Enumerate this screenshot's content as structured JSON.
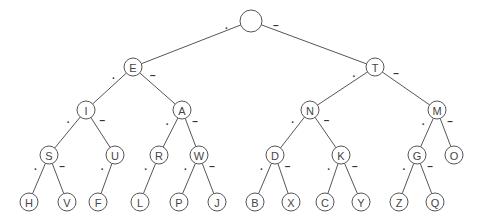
{
  "diagram": {
    "dot_symbol": ".",
    "dash_symbol": "–",
    "colors": {
      "stroke": "#555555",
      "text": "#444444",
      "background": "#ffffff"
    },
    "nodes": [
      {
        "id": "root",
        "label": "",
        "x": 251,
        "y": 21,
        "r": 11
      },
      {
        "id": "E",
        "label": "E",
        "x": 133,
        "y": 67,
        "r": 9
      },
      {
        "id": "T",
        "label": "T",
        "x": 375,
        "y": 67,
        "r": 9
      },
      {
        "id": "I",
        "label": "I",
        "x": 86,
        "y": 110,
        "r": 9
      },
      {
        "id": "A",
        "label": "A",
        "x": 182,
        "y": 110,
        "r": 9
      },
      {
        "id": "N",
        "label": "N",
        "x": 310,
        "y": 110,
        "r": 9
      },
      {
        "id": "M",
        "label": "M",
        "x": 437,
        "y": 110,
        "r": 9
      },
      {
        "id": "S",
        "label": "S",
        "x": 49,
        "y": 155,
        "r": 9
      },
      {
        "id": "U",
        "label": "U",
        "x": 115,
        "y": 155,
        "r": 9
      },
      {
        "id": "R",
        "label": "R",
        "x": 159,
        "y": 155,
        "r": 9
      },
      {
        "id": "W",
        "label": "W",
        "x": 199,
        "y": 155,
        "r": 9
      },
      {
        "id": "D",
        "label": "D",
        "x": 275,
        "y": 155,
        "r": 9
      },
      {
        "id": "K",
        "label": "K",
        "x": 341,
        "y": 155,
        "r": 9
      },
      {
        "id": "G",
        "label": "G",
        "x": 417,
        "y": 155,
        "r": 9
      },
      {
        "id": "O",
        "label": "O",
        "x": 454,
        "y": 155,
        "r": 9
      },
      {
        "id": "H",
        "label": "H",
        "x": 29,
        "y": 202,
        "r": 9
      },
      {
        "id": "V",
        "label": "V",
        "x": 67,
        "y": 202,
        "r": 9
      },
      {
        "id": "F",
        "label": "F",
        "x": 98,
        "y": 202,
        "r": 9
      },
      {
        "id": "L",
        "label": "L",
        "x": 140,
        "y": 202,
        "r": 9
      },
      {
        "id": "P",
        "label": "P",
        "x": 179,
        "y": 202,
        "r": 9
      },
      {
        "id": "J",
        "label": "J",
        "x": 217,
        "y": 202,
        "r": 9
      },
      {
        "id": "B",
        "label": "B",
        "x": 255,
        "y": 202,
        "r": 9
      },
      {
        "id": "X",
        "label": "X",
        "x": 291,
        "y": 202,
        "r": 9
      },
      {
        "id": "C",
        "label": "C",
        "x": 325,
        "y": 202,
        "r": 9
      },
      {
        "id": "Y",
        "label": "Y",
        "x": 361,
        "y": 202,
        "r": 9
      },
      {
        "id": "Z",
        "label": "Z",
        "x": 399,
        "y": 202,
        "r": 9
      },
      {
        "id": "Q",
        "label": "Q",
        "x": 435,
        "y": 202,
        "r": 9
      }
    ],
    "edges": [
      {
        "from": "root",
        "to": "E",
        "type": "dot"
      },
      {
        "from": "root",
        "to": "T",
        "type": "dash"
      },
      {
        "from": "E",
        "to": "I",
        "type": "dot"
      },
      {
        "from": "E",
        "to": "A",
        "type": "dash"
      },
      {
        "from": "T",
        "to": "N",
        "type": "dot"
      },
      {
        "from": "T",
        "to": "M",
        "type": "dash"
      },
      {
        "from": "I",
        "to": "S",
        "type": "dot"
      },
      {
        "from": "I",
        "to": "U",
        "type": "dash"
      },
      {
        "from": "A",
        "to": "R",
        "type": "dot"
      },
      {
        "from": "A",
        "to": "W",
        "type": "dash"
      },
      {
        "from": "N",
        "to": "D",
        "type": "dot"
      },
      {
        "from": "N",
        "to": "K",
        "type": "dash"
      },
      {
        "from": "M",
        "to": "G",
        "type": "dot"
      },
      {
        "from": "M",
        "to": "O",
        "type": "dash"
      },
      {
        "from": "S",
        "to": "H",
        "type": "dot"
      },
      {
        "from": "S",
        "to": "V",
        "type": "dash"
      },
      {
        "from": "U",
        "to": "F",
        "type": "dot"
      },
      {
        "from": "R",
        "to": "L",
        "type": "dot"
      },
      {
        "from": "W",
        "to": "P",
        "type": "dot"
      },
      {
        "from": "W",
        "to": "J",
        "type": "dash"
      },
      {
        "from": "D",
        "to": "B",
        "type": "dot"
      },
      {
        "from": "D",
        "to": "X",
        "type": "dash"
      },
      {
        "from": "K",
        "to": "C",
        "type": "dot"
      },
      {
        "from": "K",
        "to": "Y",
        "type": "dash"
      },
      {
        "from": "G",
        "to": "Z",
        "type": "dot"
      },
      {
        "from": "G",
        "to": "Q",
        "type": "dash"
      }
    ]
  }
}
